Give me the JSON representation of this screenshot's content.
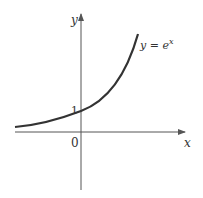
{
  "figure": {
    "y_axis_label": "y",
    "x_axis_label": "x",
    "origin_label": "0",
    "intercept_label": "1",
    "curve_label_lhs": "y",
    "curve_label_eq": " = ",
    "curve_label_base": "e",
    "curve_label_exp": "x",
    "colors": {
      "curve": "#333333",
      "axes": "#555555"
    }
  }
}
